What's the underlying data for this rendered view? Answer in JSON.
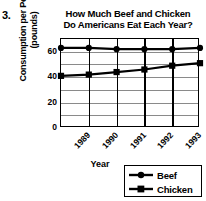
{
  "question_number": "3.",
  "chart_data": {
    "type": "line",
    "title": "How Much Beef and Chicken Do Americans Eat Each Year?",
    "title_lines": [
      "How Much Beef and Chicken",
      "Do Americans Eat Each Year?"
    ],
    "xlabel": "Year",
    "ylabel": "Consumption per Person (pounds)",
    "ylabel_lines": [
      "Consumption per Person",
      "(pounds)"
    ],
    "categories": [
      "1989",
      "1990",
      "1991",
      "1992",
      "1993",
      "1994"
    ],
    "x": [
      1989,
      1990,
      1991,
      1992,
      1993,
      1994
    ],
    "ylim": [
      0,
      70
    ],
    "xlim": [
      1989,
      1994
    ],
    "yticks": [
      "60",
      "40",
      "20",
      "0"
    ],
    "ytick_values": [
      60,
      40,
      20,
      0
    ],
    "gridlines": [
      70,
      60,
      50,
      40,
      30,
      20,
      10,
      0
    ],
    "grid": true,
    "legend_position": "bottom-right",
    "series": [
      {
        "name": "Beef",
        "marker": "circle",
        "color": "#000000",
        "values": [
          63,
          63,
          62,
          62,
          62,
          63
        ]
      },
      {
        "name": "Chicken",
        "marker": "square",
        "color": "#000000",
        "values": [
          41,
          42,
          44,
          46,
          49,
          51
        ]
      }
    ]
  },
  "legend": {
    "items": [
      {
        "label": "Beef",
        "marker": "circle"
      },
      {
        "label": "Chicken",
        "marker": "square"
      }
    ]
  }
}
